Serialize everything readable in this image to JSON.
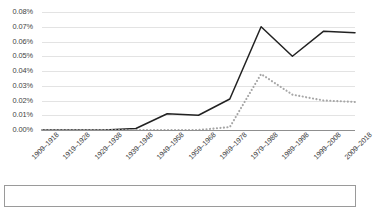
{
  "chart_data": {
    "type": "line",
    "title": "",
    "subtitle": "",
    "xlabel": "",
    "ylabel": "",
    "ylim": [
      0,
      0.0008
    ],
    "ytick_labels": [
      "0.08%",
      "0.07%",
      "0.06%",
      "0.05%",
      "0.04%",
      "0.03%",
      "0.02%",
      "0.01%",
      "0.00%"
    ],
    "ytick_values": [
      0.08,
      0.07,
      0.06,
      0.05,
      0.04,
      0.03,
      0.02,
      0.01,
      0.0
    ],
    "y_unit": "percent",
    "grid": true,
    "legend": "none",
    "categories": [
      "1909–1918",
      "1919–1928",
      "1929–1938",
      "1939–1948",
      "1949–1958",
      "1959–1968",
      "1969–1978",
      "1979–1988",
      "1989–1998",
      "1999–2008",
      "2009–2018"
    ],
    "series": [
      {
        "name": "series-solid",
        "style": "solid",
        "color": "#222222",
        "values": [
          0.0,
          0.0,
          0.0,
          0.001,
          0.011,
          0.01,
          0.021,
          0.07,
          0.05,
          0.067,
          0.066
        ]
      },
      {
        "name": "series-dotted",
        "style": "dotted",
        "color": "#a6a6a6",
        "values": [
          0.0,
          0.0,
          0.0,
          0.0,
          0.0,
          0.0,
          0.002,
          0.038,
          0.024,
          0.02,
          0.019
        ]
      }
    ]
  },
  "colors": {
    "background": "#ffffff",
    "grid": "#e3e3e3",
    "axis": "#8f8f8f",
    "border": "#9a9a9a",
    "text": "#3f3f3f"
  }
}
